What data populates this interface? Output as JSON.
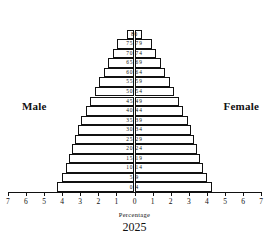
{
  "chart_data": {
    "type": "bar",
    "subtype": "population-pyramid",
    "title": "2025",
    "xlabel": "Percentage",
    "ylabel": "",
    "xlim": [
      -7,
      7
    ],
    "grid": false,
    "legend_position": "inside-plot",
    "axis_ticks": [
      7,
      6,
      5,
      4,
      3,
      2,
      1,
      0,
      1,
      2,
      3,
      4,
      5,
      6,
      7
    ],
    "annotations": [
      "Male",
      "Female"
    ],
    "categories": [
      "0 4",
      "5 9",
      "10 14",
      "15 19",
      "20 24",
      "25 29",
      "30 34",
      "35 39",
      "40 44",
      "45 49",
      "50 54",
      "55 59",
      "60 64",
      "65 69",
      "70 74",
      "75 79",
      "80"
    ],
    "series": [
      {
        "name": "Male",
        "values": [
          4.3,
          4.0,
          3.8,
          3.6,
          3.45,
          3.3,
          3.1,
          2.95,
          2.7,
          2.45,
          2.2,
          1.95,
          1.7,
          1.45,
          1.2,
          0.95,
          0.4
        ]
      },
      {
        "name": "Female",
        "values": [
          4.3,
          4.0,
          3.8,
          3.6,
          3.45,
          3.3,
          3.1,
          2.95,
          2.7,
          2.45,
          2.2,
          1.95,
          1.7,
          1.45,
          1.2,
          0.95,
          0.4
        ]
      }
    ]
  },
  "labels": {
    "male": "Male",
    "female": "Female",
    "percentage": "Percentage",
    "year": "2025"
  }
}
